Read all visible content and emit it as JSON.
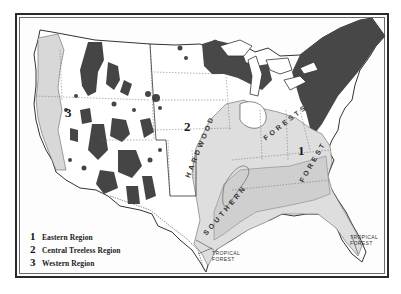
{
  "map": {
    "subject": "Forest regions of the United States",
    "colors": {
      "frame": "#2a2a2a",
      "dark_forest": "#4a4a4a",
      "light_forest": "#dcdcdc",
      "boundary": "#555555",
      "paper": "#fdfdfd"
    },
    "region_numbers": [
      {
        "id": "1",
        "label": "1"
      },
      {
        "id": "2",
        "label": "2"
      },
      {
        "id": "3",
        "label": "3"
      }
    ],
    "forest_labels": {
      "hardwood": "HARDWOOD",
      "northern": "FORESTS",
      "southern": "SOUTHERN",
      "southern_forest": "FOREST",
      "tropical_west": [
        "TROPICAL",
        "FOREST"
      ],
      "tropical_east": [
        "TROPICAL",
        "FOREST"
      ]
    }
  },
  "legend": {
    "items": [
      {
        "number": "1",
        "label": "Eastern Region"
      },
      {
        "number": "2",
        "label": "Central Treeless Region"
      },
      {
        "number": "3",
        "label": "Western Region"
      }
    ]
  }
}
